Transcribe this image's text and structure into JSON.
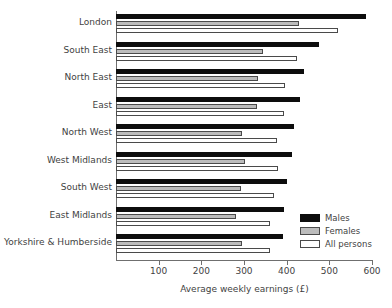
{
  "chart_data": {
    "type": "bar",
    "orientation": "horizontal",
    "title": "",
    "xlabel": "Average weekly earnings (£)",
    "ylabel": "",
    "xlim": [
      0,
      600
    ],
    "xticks": [
      100,
      200,
      300,
      400,
      500,
      600
    ],
    "grid": false,
    "legend_position": "bottom-right",
    "categories": [
      "London",
      "South East",
      "North East",
      "East",
      "North West",
      "West Midlands",
      "South West",
      "East Midlands",
      "Yorkshire & Humberside"
    ],
    "series": [
      {
        "name": "Males",
        "color": "#0d0d0d",
        "values": [
          585,
          475,
          440,
          432,
          418,
          412,
          400,
          394,
          392
        ]
      },
      {
        "name": "Females",
        "color": "#bcbcbc",
        "values": [
          428,
          345,
          332,
          330,
          296,
          303,
          293,
          281,
          296
        ]
      },
      {
        "name": "All persons",
        "color": "#ffffff",
        "values": [
          521,
          424,
          395,
          394,
          377,
          380,
          371,
          360,
          362
        ]
      }
    ]
  },
  "legend": {
    "items": [
      {
        "label": "Males"
      },
      {
        "label": "Females"
      },
      {
        "label": "All persons"
      }
    ]
  }
}
